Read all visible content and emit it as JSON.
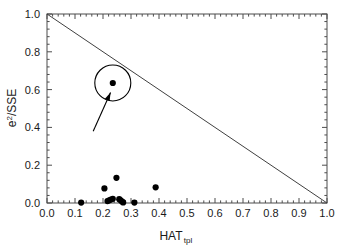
{
  "chart_data": {
    "type": "scatter",
    "title": "",
    "xlabel": "HAT",
    "xlabel_sub": "tpl",
    "ylabel_main": "e",
    "ylabel_sup": "2",
    "ylabel_rest": "/SSE",
    "ylabel_full": "e2/SSE",
    "xlim": [
      0.0,
      1.0
    ],
    "ylim": [
      0.0,
      1.0
    ],
    "xticks": [
      "0.0",
      "0.1",
      "0.2",
      "0.3",
      "0.4",
      "0.5",
      "0.6",
      "0.7",
      "0.8",
      "0.9",
      "1.0"
    ],
    "xtick_values": [
      0.0,
      0.1,
      0.2,
      0.3,
      0.4,
      0.5,
      0.6,
      0.7,
      0.8,
      0.9,
      1.0
    ],
    "yticks": [
      "0.0",
      "0.2",
      "0.4",
      "0.6",
      "0.8",
      "1.0"
    ],
    "ytick_values": [
      0.0,
      0.2,
      0.4,
      0.6,
      0.8,
      1.0
    ],
    "minor_ticks_per_interval": 5,
    "grid": false,
    "legend": false,
    "frame": true,
    "tick_direction": "in",
    "series": [
      {
        "name": "observations",
        "marker": "filled-circle",
        "color": "#000000",
        "points": [
          [
            0.122,
            0.002
          ],
          [
            0.205,
            0.077
          ],
          [
            0.216,
            0.01
          ],
          [
            0.222,
            0.014
          ],
          [
            0.228,
            0.018
          ],
          [
            0.235,
            0.022
          ],
          [
            0.248,
            0.133
          ],
          [
            0.258,
            0.02
          ],
          [
            0.263,
            0.014
          ],
          [
            0.268,
            0.008
          ],
          [
            0.272,
            0.003
          ],
          [
            0.312,
            0.002
          ],
          [
            0.388,
            0.083
          ],
          [
            0.235,
            0.635
          ]
        ]
      }
    ],
    "reference_line": {
      "name": "diagonal-boundary",
      "from": [
        0.0,
        1.0
      ],
      "to": [
        1.0,
        0.0
      ],
      "color": "#404040"
    },
    "annotations": [
      {
        "type": "circle-highlight",
        "name": "highlight-circle",
        "center": [
          0.235,
          0.635
        ],
        "radius_px": 18,
        "color": "#000000"
      },
      {
        "type": "arrow",
        "name": "callout-arrow",
        "from": [
          0.165,
          0.38
        ],
        "to": [
          0.227,
          0.585
        ],
        "color": "#000000"
      }
    ]
  }
}
